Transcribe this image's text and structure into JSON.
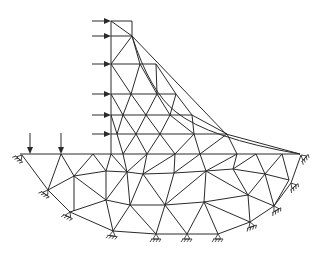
{
  "diagram": {
    "title": "",
    "colors": {
      "line": "#2a2a2a",
      "background": "#ffffff"
    },
    "nodes": {
      "c1": [
        111,
        21
      ],
      "c2": [
        132,
        21
      ],
      "a1": [
        111,
        36
      ],
      "a2": [
        132,
        36
      ],
      "b1": [
        111,
        64
      ],
      "b2": [
        140,
        64
      ],
      "b3": [
        156,
        64
      ],
      "d1": [
        111,
        94
      ],
      "d2": [
        131,
        94
      ],
      "d3": [
        157,
        94
      ],
      "d4": [
        176,
        94
      ],
      "e1": [
        111,
        115
      ],
      "e2": [
        123,
        115
      ],
      "e3": [
        146,
        115
      ],
      "e4": [
        170,
        115
      ],
      "e5": [
        192,
        115
      ],
      "f1": [
        111,
        134
      ],
      "f2": [
        117,
        134
      ],
      "f3": [
        136,
        134
      ],
      "f4": [
        160,
        134
      ],
      "f5": [
        194,
        134
      ],
      "f6": [
        227,
        134
      ],
      "g0": [
        20,
        154
      ],
      "g1": [
        30,
        154
      ],
      "g2": [
        61,
        154
      ],
      "g3": [
        93,
        154
      ],
      "g4": [
        111,
        154
      ],
      "g5": [
        123,
        154
      ],
      "g6": [
        147,
        154
      ],
      "g7": [
        175,
        154
      ],
      "g8": [
        200,
        154
      ],
      "g9": [
        237,
        154
      ],
      "g10": [
        256,
        154
      ],
      "g11": [
        282,
        154
      ],
      "g12": [
        300,
        154
      ],
      "h1": [
        74,
        176
      ],
      "h2": [
        106,
        171
      ],
      "h3": [
        127,
        172
      ],
      "h4": [
        143,
        174
      ],
      "h5": [
        174,
        173
      ],
      "h6": [
        206,
        171
      ],
      "h7": [
        233,
        169
      ],
      "h8": [
        265,
        174
      ],
      "i1": [
        52,
        188
      ],
      "i2": [
        74,
        225
      ],
      "i3": [
        106,
        200
      ],
      "i4": [
        130,
        205
      ],
      "i5": [
        175,
        205
      ],
      "i6": [
        204,
        202
      ],
      "i7": [
        248,
        195
      ],
      "i8": [
        273,
        181
      ],
      "i9": [
        289,
        180
      ],
      "j1": [
        47,
        205
      ],
      "j2": [
        92,
        225
      ],
      "j3": [
        165,
        222
      ],
      "j4": [
        215,
        212
      ],
      "j5": [
        253,
        220
      ],
      "j6": [
        272,
        205
      ],
      "k1": [
        69,
        211
      ],
      "k2": [
        113,
        229
      ],
      "k3": [
        156,
        232
      ],
      "k4": [
        187,
        232
      ],
      "k5": [
        218,
        232
      ],
      "k6": [
        237,
        228
      ]
    },
    "elements_note": "Triangular mesh connecting nodes",
    "loads": {
      "horizontal_arrows_y": [
        21,
        36,
        64,
        94,
        115,
        134
      ],
      "vertical_arrows_x": [
        30,
        61
      ]
    },
    "supports": {
      "count": 11,
      "positions": [
        [
          22,
          157
        ],
        [
          48,
          190
        ],
        [
          70,
          212
        ],
        [
          113,
          231
        ],
        [
          156,
          234
        ],
        [
          187,
          234
        ],
        [
          218,
          234
        ],
        [
          250,
          222
        ],
        [
          274,
          206
        ],
        [
          291,
          183
        ],
        [
          301,
          155
        ]
      ]
    }
  }
}
